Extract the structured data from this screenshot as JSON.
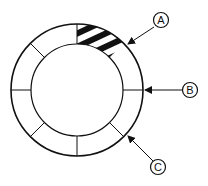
{
  "diagram": {
    "type": "ring-segment-diagram",
    "ring": {
      "center": [
        77,
        90
      ],
      "outer_radius": 66,
      "inner_radius": 46,
      "segments": 8,
      "stroke_color": "#111111",
      "highlighted_segment": {
        "index": 0,
        "pattern": "diagonal-stripes",
        "fill": "#111111"
      }
    },
    "callouts": [
      {
        "id": "A",
        "label": "A",
        "circle": [
          161,
          20
        ],
        "arrow_to": [
          128,
          44
        ]
      },
      {
        "id": "B",
        "label": "B",
        "circle": [
          190,
          90
        ],
        "arrow_to": [
          145,
          90
        ]
      },
      {
        "id": "C",
        "label": "C",
        "circle": [
          158,
          167
        ],
        "arrow_to": [
          128,
          136
        ]
      }
    ]
  }
}
